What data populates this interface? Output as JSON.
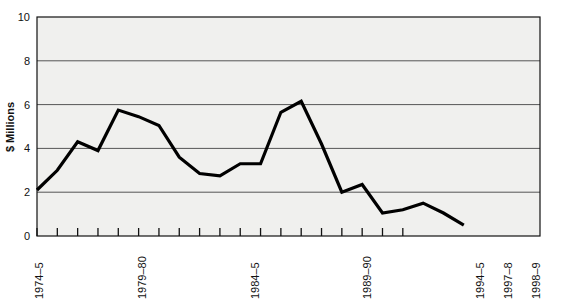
{
  "chart_data": {
    "type": "line",
    "title": "",
    "subtitle": "",
    "xlabel": "",
    "ylabel": "$ Millions",
    "ylim": [
      0,
      10
    ],
    "yticks": [
      0,
      2,
      4,
      6,
      8,
      10
    ],
    "ytick_labels": [
      "0",
      "2",
      "4",
      "6",
      "8",
      "10"
    ],
    "grid": true,
    "grid_axis": "y",
    "legend": false,
    "legend_position": "none",
    "n_points": 22,
    "x_index": [
      0,
      1,
      2,
      3,
      4,
      5,
      6,
      7,
      8,
      9,
      10,
      11,
      12,
      13,
      14,
      15,
      16,
      17,
      18,
      19,
      20,
      21
    ],
    "categories": [
      "1974-5",
      "1975-6",
      "1976-7",
      "1977-8",
      "1978-9",
      "1979-80",
      "1980-1",
      "1981-2",
      "1982-3",
      "1983-4",
      "1984-5",
      "1985-6",
      "1986-7",
      "1987-8",
      "1988-9",
      "1989-90",
      "1990-1",
      "1991-2",
      "1992-3",
      "1993-4",
      "1994-5",
      "1995-6"
    ],
    "values": [
      2.1,
      3.0,
      4.3,
      3.9,
      5.75,
      5.45,
      5.05,
      3.6,
      2.85,
      2.75,
      3.3,
      3.3,
      5.65,
      6.15,
      4.2,
      2.0,
      2.35,
      1.05,
      1.2,
      1.5,
      1.05,
      0.5
    ],
    "labelled_xticks": [
      {
        "index": 0,
        "label": "1974–5"
      },
      {
        "index": 5,
        "label": "1979–80"
      },
      {
        "index": 10,
        "label": "1984–5"
      },
      {
        "index": 15,
        "label": "1989–90"
      },
      {
        "index": 20,
        "label": "1994–5"
      },
      {
        "index": 23,
        "label": "1997–8"
      },
      {
        "index": 24,
        "label": "1998–9"
      }
    ],
    "tick_count": 19,
    "series_name": "",
    "line_color": "#000000",
    "line_width": 3.2,
    "plot_background": "#f0f0ee",
    "grid_color": "#555555",
    "axis_color": "#111111"
  },
  "axes": {
    "y_axis_title": "$ Millions",
    "y_tick_labels": [
      "0",
      "2",
      "4",
      "6",
      "8",
      "10"
    ],
    "x_tick_labels": [
      "1974–5",
      "1979–80",
      "1984–5",
      "1989–90",
      "1994–5",
      "1997–8",
      "1998–9"
    ]
  }
}
